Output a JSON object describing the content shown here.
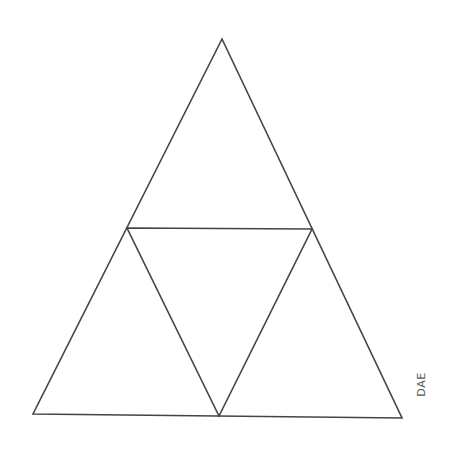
{
  "diagram": {
    "type": "sierpinski-triangle-level-1",
    "stroke_color": "#444444",
    "stroke_width": 1.6,
    "outer_triangle": {
      "apex": [
        222,
        39
      ],
      "bottom_left": [
        33,
        414
      ],
      "bottom_right": [
        402,
        418
      ]
    },
    "inner_triangle": {
      "left_mid": [
        127,
        228
      ],
      "right_mid": [
        312,
        229
      ],
      "bottom_mid": [
        219,
        416
      ]
    },
    "credit_label": "DAE"
  }
}
